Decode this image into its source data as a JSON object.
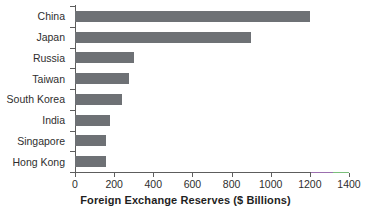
{
  "chart_data": {
    "type": "bar",
    "orientation": "horizontal",
    "title": "",
    "xlabel": "Foreign Exchange Reserves ($ Billions)",
    "ylabel": "",
    "categories": [
      "China",
      "Japan",
      "Russia",
      "Taiwan",
      "South Korea",
      "India",
      "Singapore",
      "Hong Kong"
    ],
    "values": [
      1200,
      900,
      300,
      275,
      240,
      180,
      160,
      160
    ],
    "xlim": [
      0,
      1400
    ],
    "xticks": [
      0,
      200,
      400,
      600,
      800,
      1000,
      1200,
      1400
    ],
    "xtick_labels": [
      "0",
      "200",
      "400",
      "600",
      "800",
      "1000",
      "1200",
      "1400"
    ],
    "grid": false,
    "legend": false,
    "bar_color": "#6e7175",
    "axis_color": "#5d5d5d",
    "background": "#ffffff"
  },
  "artifacts": {
    "axis_tint_purple": "#9b6fae",
    "axis_tint_green": "#7bbf7b"
  }
}
